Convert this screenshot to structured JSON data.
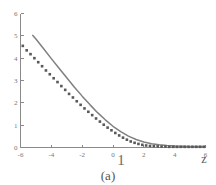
{
  "figure": {
    "caption": "(a)",
    "stray_label": "1",
    "xaxis_label": "z"
  },
  "colors": {
    "line": "#808080",
    "markers": "#595959",
    "axis": "#8a8a8a",
    "tick_text": "#777777",
    "background": "#ffffff"
  },
  "chart_data": {
    "type": "line",
    "title": "",
    "subtitle": "",
    "xlabel": "z",
    "ylabel": "",
    "xlim": [
      -6,
      6
    ],
    "ylim": [
      0,
      6
    ],
    "grid": false,
    "legend": "none",
    "xticks": [
      -6,
      -4,
      -2,
      0,
      2,
      4,
      6
    ],
    "xticklabels": [
      "-6",
      "-4",
      "-2",
      "0",
      "2",
      "4",
      "6"
    ],
    "yticks": [
      0,
      1,
      2,
      3,
      4,
      5,
      6
    ],
    "yticklabels": [
      "0",
      "1",
      "2",
      "3",
      "4",
      "5",
      "6"
    ],
    "annotations": [
      {
        "text": "(a)",
        "role": "caption",
        "position": "below-axes-center"
      },
      {
        "text": "1",
        "role": "stray-glyph",
        "position": "below-x-tick-0"
      },
      {
        "text": "z",
        "role": "axis-label",
        "position": "below-right-end"
      }
    ],
    "series": [
      {
        "name": "solid curve",
        "style": "solid-line",
        "color": "#808080",
        "x": [
          -5.2,
          -5.0,
          -4.5,
          -4.0,
          -3.5,
          -3.0,
          -2.5,
          -2.0,
          -1.5,
          -1.0,
          -0.5,
          0.0,
          0.5,
          1.0,
          1.5,
          2.0,
          2.5,
          3.0,
          3.5,
          4.0,
          4.5,
          5.0,
          5.5,
          6.0
        ],
        "y": [
          5.02,
          4.86,
          4.42,
          3.98,
          3.55,
          3.12,
          2.7,
          2.3,
          1.92,
          1.56,
          1.24,
          0.95,
          0.71,
          0.51,
          0.36,
          0.25,
          0.17,
          0.12,
          0.09,
          0.07,
          0.06,
          0.05,
          0.05,
          0.05
        ]
      },
      {
        "name": "dotted series",
        "style": "square-markers",
        "color": "#595959",
        "x": [
          -5.85,
          -5.6,
          -5.35,
          -5.1,
          -4.85,
          -4.6,
          -4.35,
          -4.1,
          -3.85,
          -3.6,
          -3.35,
          -3.1,
          -2.85,
          -2.6,
          -2.35,
          -2.1,
          -1.85,
          -1.6,
          -1.35,
          -1.1,
          -0.85,
          -0.6,
          -0.35,
          -0.1,
          0.15,
          0.4,
          0.65,
          0.9,
          1.15,
          1.4,
          1.65,
          1.9,
          2.15,
          2.4,
          2.65,
          2.9,
          3.15,
          3.4,
          3.65,
          3.9,
          4.15,
          4.4,
          4.65,
          4.9,
          5.15,
          5.4,
          5.65,
          5.9
        ],
        "y": [
          4.55,
          4.35,
          4.18,
          4.0,
          3.82,
          3.64,
          3.45,
          3.28,
          3.1,
          2.93,
          2.75,
          2.58,
          2.4,
          2.24,
          2.07,
          1.91,
          1.75,
          1.6,
          1.45,
          1.3,
          1.16,
          1.02,
          0.89,
          0.77,
          0.65,
          0.54,
          0.44,
          0.35,
          0.27,
          0.21,
          0.16,
          0.12,
          0.09,
          0.07,
          0.06,
          0.05,
          0.04,
          0.04,
          0.03,
          0.03,
          0.03,
          0.03,
          0.03,
          0.03,
          0.03,
          0.03,
          0.03,
          0.03
        ]
      }
    ]
  }
}
